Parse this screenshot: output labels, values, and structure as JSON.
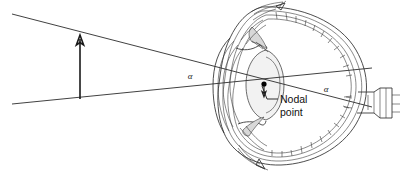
{
  "figure": {
    "type": "optics-anatomy-diagram",
    "background_color": "#ffffff",
    "ink_color": "#1a1a1a",
    "width": 402,
    "height": 172
  },
  "labels": {
    "angle_object_side": "α",
    "angle_image_side": "α",
    "nodal_point_line1": "Nodal",
    "nodal_point_line2": "point"
  },
  "annotations": {
    "object_arrow_name": "object-arrow",
    "image_arrow_name": "inverted-retinal-image-arrow",
    "nodal_point_name": "nodal-point-dot",
    "upper_ray_name": "upper-chief-ray",
    "lower_ray_name": "lower-chief-ray",
    "leader_name": "nodal-point-leader-line"
  },
  "anatomy_parts": [
    "cornea",
    "anterior-chamber",
    "iris",
    "crystalline-lens",
    "ciliary-body",
    "sclera",
    "choroid",
    "retina",
    "vitreous-chamber",
    "optic-nerve"
  ],
  "geometry": {
    "object_arrow_x": 80,
    "object_arrow_top_y": 37,
    "object_arrow_bottom_y": 99,
    "nodal_point_x": 264,
    "nodal_point_y": 84,
    "upper_ray_start": [
      12,
      14
    ],
    "lower_ray_start": [
      12,
      104
    ],
    "upper_ray_end": [
      372,
      107
    ],
    "lower_ray_end": [
      372,
      68
    ],
    "angle_object_label_pos": [
      190,
      78
    ],
    "angle_image_label_pos": [
      326,
      91
    ],
    "nodal_label_pos": [
      281,
      105
    ]
  }
}
